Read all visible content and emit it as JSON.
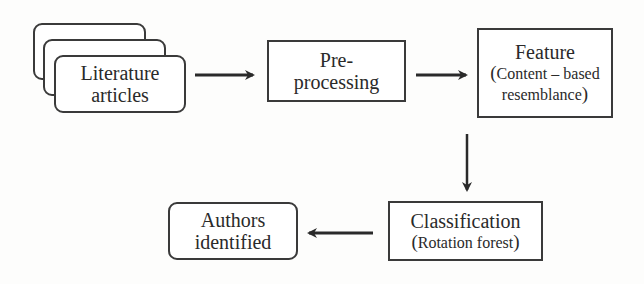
{
  "diagram": {
    "type": "flowchart",
    "nodes": {
      "literature": {
        "line1": "Literature",
        "line2": "articles",
        "shape": "stacked-rounded-rect"
      },
      "preprocessing": {
        "line1": "Pre-",
        "line2": "processing",
        "shape": "rect"
      },
      "feature": {
        "title": "Feature",
        "paren_open": "(",
        "sub1": "Content – based",
        "sub2": "resemblance",
        "paren_close": ")",
        "shape": "rect"
      },
      "classification": {
        "title": "Classification",
        "paren_open": "(",
        "sub": "Rotation forest",
        "paren_close": ")",
        "shape": "rect"
      },
      "authors": {
        "line1": "Authors",
        "line2": "identified",
        "shape": "rounded-rect"
      }
    },
    "edges": [
      {
        "from": "literature",
        "to": "preprocessing",
        "direction": "right"
      },
      {
        "from": "preprocessing",
        "to": "feature",
        "direction": "right"
      },
      {
        "from": "feature",
        "to": "classification",
        "direction": "down"
      },
      {
        "from": "classification",
        "to": "authors",
        "direction": "left"
      }
    ],
    "colors": {
      "stroke": "#3a3a3a",
      "text": "#2a2a2a",
      "background": "#fdfdfc"
    }
  }
}
